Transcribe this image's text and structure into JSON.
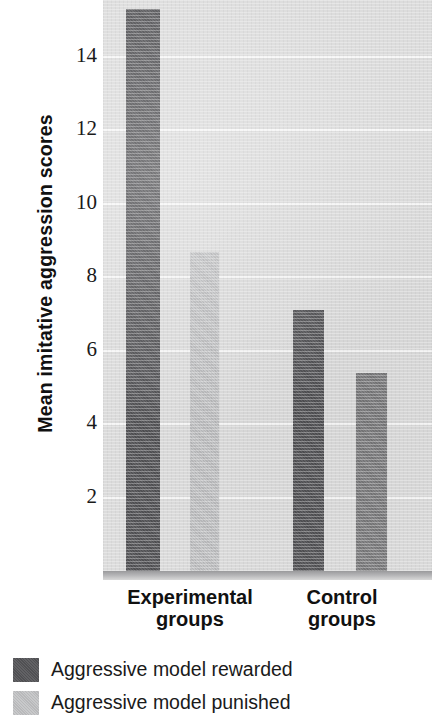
{
  "chart_data": {
    "type": "bar",
    "title": "",
    "xlabel": "",
    "ylabel": "Mean imitative aggression scores",
    "categories": [
      "Experimental groups",
      "Control groups"
    ],
    "category_lines": [
      [
        "Experimental",
        "groups"
      ],
      [
        "Control",
        "groups"
      ]
    ],
    "series": [
      {
        "name": "Aggressive model rewarded",
        "color": "#555558",
        "values": [
          15.3,
          7.1
        ]
      },
      {
        "name": "Aggressive model punished",
        "color": "#c3c4c6",
        "values": [
          8.7,
          5.4
        ]
      }
    ],
    "ylim": [
      0,
      15.6
    ],
    "yticks": [
      2,
      4,
      6,
      8,
      10,
      12,
      14
    ],
    "ytick_labels": [
      "2",
      "4",
      "6",
      "8",
      "10",
      "12",
      "14"
    ],
    "grid": true,
    "gridline_color": "#f6f6f6",
    "plot_background": "#dcdcdc",
    "legend_position": "below-plot"
  },
  "legend": {
    "items": [
      {
        "label": "Aggressive model rewarded",
        "swatch_name": "legend-swatch-rewarded"
      },
      {
        "label": "Aggressive model punished",
        "swatch_name": "legend-swatch-punished"
      }
    ]
  },
  "axis": {
    "y_title": "Mean imitative aggression scores",
    "ticks": [
      "14",
      "12",
      "10",
      "8",
      "6",
      "4",
      "2"
    ]
  },
  "x_categories": [
    {
      "line1": "Experimental",
      "line2": "groups"
    },
    {
      "line1": "Control",
      "line2": "groups"
    }
  ],
  "colors": {
    "bar_dark": "#555558",
    "bar_light": "#c3c4c6",
    "plot_bg": "#dcdcdc",
    "gridline": "#f6f6f6",
    "text": "#111111"
  }
}
